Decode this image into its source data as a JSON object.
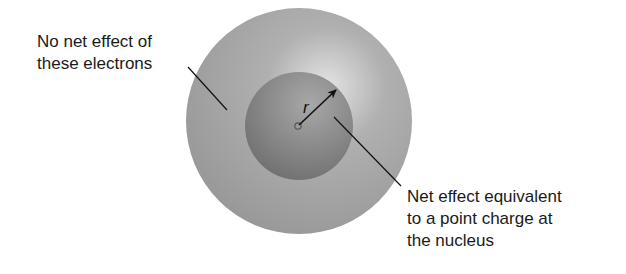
{
  "diagram": {
    "left_label": {
      "lines": [
        "No net effect of",
        "these electrons"
      ]
    },
    "right_label": {
      "lines": [
        "Net effect equivalent",
        "to a point charge at",
        "the nucleus"
      ]
    },
    "radius_label": "r",
    "shapes": {
      "outer_shell": {
        "cx": 299,
        "cy": 121,
        "r": 113,
        "color": "#9a9a9a"
      },
      "inner_sphere": {
        "cx": 299,
        "cy": 126,
        "r": 54,
        "color": "#7e7e7e"
      },
      "nucleus": {
        "cx": 298,
        "cy": 126,
        "r": 3
      }
    }
  }
}
